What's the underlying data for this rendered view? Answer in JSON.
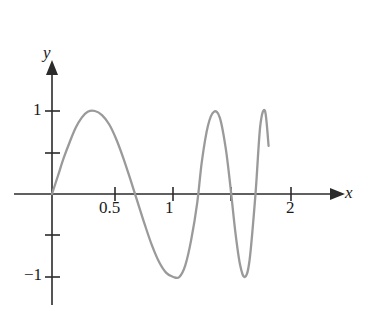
{
  "figure": {
    "background_color": "#ffffff",
    "axis_color": "#2b2b2b",
    "curve_color": "#9a9a9a",
    "text_color": "#1a1a1a"
  },
  "axes": {
    "x_axis_label": "x",
    "y_axis_label": "y",
    "x_tick_labels": [
      "0.5",
      "1",
      "2"
    ],
    "y_tick_labels": [
      "1",
      "−1"
    ]
  },
  "chart_data": {
    "type": "line",
    "title": "",
    "xlabel": "x",
    "ylabel": "y",
    "xlim": [
      -0.05,
      2.3
    ],
    "ylim": [
      -1.35,
      1.35
    ],
    "grid": false,
    "legend": null,
    "x_ticks": [
      0.5,
      1,
      1.5,
      2
    ],
    "x_tick_labels": [
      "0.5",
      "1",
      "",
      "2"
    ],
    "y_ticks": [
      1,
      0.5,
      -0.5,
      -1
    ],
    "y_tick_labels": [
      "1",
      "",
      "",
      "−1"
    ],
    "series": [
      {
        "name": "y",
        "x": [
          0.0,
          0.05,
          0.1,
          0.15,
          0.2,
          0.25,
          0.3,
          0.36,
          0.42,
          0.48,
          0.54,
          0.6,
          0.66,
          0.72,
          0.78,
          0.84,
          0.9,
          0.96,
          1.02,
          1.07,
          1.12,
          1.17,
          1.22,
          1.26,
          1.31,
          1.36,
          1.41,
          1.46,
          1.5,
          1.54,
          1.58,
          1.62,
          1.66,
          1.71,
          1.75,
          1.79,
          1.82
        ],
        "y": [
          0.0,
          0.22,
          0.44,
          0.63,
          0.8,
          0.92,
          0.99,
          1.0,
          0.95,
          0.84,
          0.66,
          0.43,
          0.17,
          -0.1,
          -0.37,
          -0.62,
          -0.82,
          -0.95,
          -1.0,
          -1.0,
          -0.86,
          -0.55,
          -0.11,
          0.4,
          0.82,
          0.99,
          0.92,
          0.55,
          0.08,
          -0.45,
          -0.85,
          -1.0,
          -0.8,
          0.0,
          0.82,
          1.0,
          0.58
        ]
      }
    ],
    "features": {
      "zero_crossings": [
        0.0,
        0.68,
        1.24,
        1.51,
        1.71
      ],
      "maxima_x": [
        0.36,
        1.31,
        1.79
      ],
      "maxima_y": [
        1.0,
        1.0,
        1.0
      ],
      "minima_x": [
        1.05,
        1.62
      ],
      "minima_y": [
        -1.0,
        -1.0
      ],
      "endpoint_x": 1.82,
      "endpoint_y": 0.58
    }
  }
}
